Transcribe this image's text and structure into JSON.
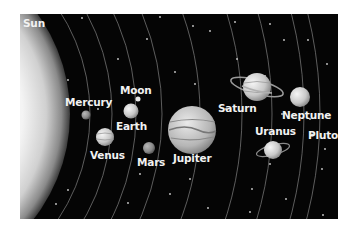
{
  "sun": {
    "label": "Sun"
  },
  "bodies": [
    {
      "id": "mercury",
      "label": "Mercury",
      "kind": "planet"
    },
    {
      "id": "venus",
      "label": "Venus",
      "kind": "planet"
    },
    {
      "id": "earth",
      "label": "Earth",
      "kind": "planet"
    },
    {
      "id": "moon",
      "label": "Moon",
      "kind": "moon"
    },
    {
      "id": "mars",
      "label": "Mars",
      "kind": "planet"
    },
    {
      "id": "jupiter",
      "label": "Jupiter",
      "kind": "planet"
    },
    {
      "id": "saturn",
      "label": "Saturn",
      "kind": "planet",
      "rings": true
    },
    {
      "id": "uranus",
      "label": "Uranus",
      "kind": "planet",
      "rings": true
    },
    {
      "id": "neptune",
      "label": "Neptune",
      "kind": "planet"
    },
    {
      "id": "pluto",
      "label": "Pluto",
      "kind": "dwarf-planet"
    }
  ],
  "colors": {
    "space": "#050505",
    "orbit": "#9a9a9a",
    "label": "#f2f2f2",
    "sun_core": "#ffffff",
    "sun_edge": "#7a7a7a"
  }
}
